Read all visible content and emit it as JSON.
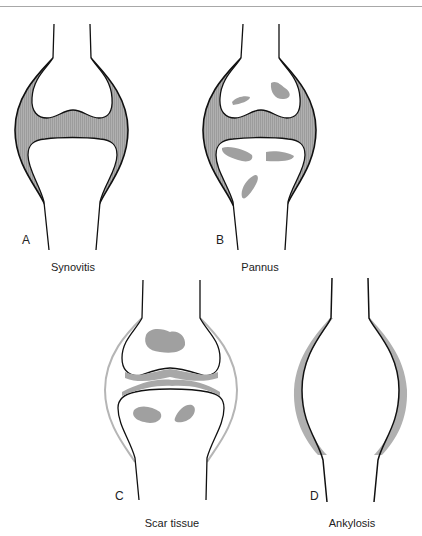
{
  "figure": {
    "panels": [
      {
        "id": "A",
        "letter": "A",
        "caption": "Synovitis"
      },
      {
        "id": "B",
        "letter": "B",
        "caption": "Pannus"
      },
      {
        "id": "C",
        "letter": "C",
        "caption": "Scar tissue"
      },
      {
        "id": "D",
        "letter": "D",
        "caption": "Ankylosis"
      }
    ],
    "colors": {
      "outline": "#111111",
      "synovium_fill": "#a9a9a9",
      "erosion_fill": "#a0a0a0",
      "scar_outline": "#b5b5b5",
      "ankylosis_fill": "#b0b0b0"
    }
  }
}
